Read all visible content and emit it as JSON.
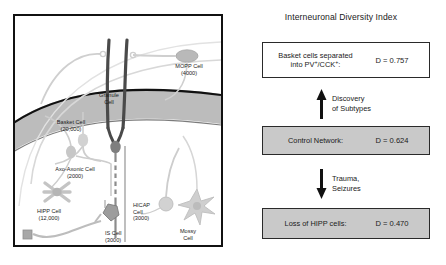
{
  "left_panel": {
    "name": "dentate-gyrus-circuit-diagram",
    "cells": [
      {
        "id": "mopp",
        "label": "MOPP Cell",
        "count": "(4000)",
        "x": 151,
        "y": 47,
        "w": 46
      },
      {
        "id": "granule",
        "label": "Granule\nCell",
        "count": "",
        "x": 74,
        "y": 76,
        "w": 40
      },
      {
        "id": "basket",
        "label": "Basket Cell",
        "count": "(20,000)",
        "x": 30,
        "y": 103,
        "w": 52
      },
      {
        "id": "axo-axonic",
        "label": "Axo-Axonic Cell",
        "count": "(2000)",
        "x": 28,
        "y": 150,
        "w": 64
      },
      {
        "id": "hipp",
        "label": "HIPP Cell",
        "count": "(12,000)",
        "x": 10,
        "y": 192,
        "w": 48
      },
      {
        "id": "is",
        "label": "IS Cell",
        "count": "(3000)",
        "x": 90,
        "y": 214,
        "w": 32
      },
      {
        "id": "hicap",
        "label": "HICAP\nCell",
        "count": "(3000)",
        "x": 118,
        "y": 190,
        "w": 32
      },
      {
        "id": "mossy",
        "label": "Mossy\nCell",
        "count": "",
        "x": 158,
        "y": 212,
        "w": 30
      }
    ]
  },
  "right_panel": {
    "title": "Interneuronal Diversity Index",
    "boxes": [
      {
        "id": "box-top",
        "label": "Basket cells separated\ninto PV +/CCK+:",
        "label_html": "Basket cells separated<br>into PV<sup>+</sup>/CCK<sup>+</sup>:",
        "value": "D = 0.757",
        "shaded": false
      },
      {
        "id": "box-mid",
        "label": "Control Network:",
        "label_html": "Control Network:",
        "value": "D = 0.624",
        "shaded": true
      },
      {
        "id": "box-bot",
        "label": "Loss of HIPP cells:",
        "label_html": "Loss of HIPP cells:",
        "value": "D = 0.470",
        "shaded": true
      }
    ],
    "arrows": [
      {
        "id": "arrow-up",
        "direction": "up",
        "text": "Discovery\nof Subtypes"
      },
      {
        "id": "arrow-down",
        "direction": "down",
        "text": "Trauma,\nSeizures"
      }
    ]
  },
  "colors": {
    "frame": "#111111",
    "box_border": "#2a2a2a",
    "box_shaded_fill": "#c9c9c9",
    "text": "#1a1a1a",
    "granule_layer_fill": "#b8b8b8",
    "granule_layer_line": "#111111",
    "cell_gray": "#b3b3b3",
    "cell_gray_dark": "#8f8f8f",
    "axon_gray": "#c0c0c0"
  }
}
